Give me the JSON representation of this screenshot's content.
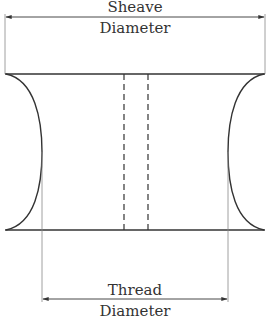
{
  "diagram": {
    "type": "sheave-cross-section",
    "colors": {
      "stroke": "#333333",
      "thin": "#888888",
      "background": "#ffffff"
    },
    "labels": {
      "sheave_line1": "Sheave",
      "sheave_line2": "Diameter",
      "thread_line1": "Thread",
      "thread_line2": "Diameter"
    }
  }
}
